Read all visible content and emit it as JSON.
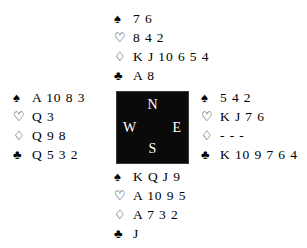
{
  "diagram": {
    "type": "bridge-deal-diagram",
    "suit_symbols": {
      "spade": "♠",
      "heart": "♡",
      "diamond": "♢",
      "club": "♣"
    },
    "compass": {
      "north": "N",
      "west": "W",
      "east": "E",
      "south": "S",
      "box_color": "#0a0a0a",
      "letter_color": "#ffffff"
    },
    "background_color": "#ffffff",
    "text_color": "#000000"
  },
  "hands": {
    "north": {
      "label": "North",
      "spades": "7 6",
      "hearts": "8 4 2",
      "diamonds": "K J 10 6 5 4",
      "clubs": "A 8"
    },
    "west": {
      "label": "West",
      "spades": "A 10 8 3",
      "hearts": "Q 3",
      "diamonds": "Q 9 8",
      "clubs": "Q 5 3 2"
    },
    "east": {
      "label": "East",
      "spades": "5 4 2",
      "hearts": "K J 7 6",
      "diamonds": "- - -",
      "clubs": "K 10 9 7 6 4"
    },
    "south": {
      "label": "South",
      "spades": "K Q J 9",
      "hearts": "A 10 9 5",
      "diamonds": "A 7 3 2",
      "clubs": "J"
    }
  }
}
